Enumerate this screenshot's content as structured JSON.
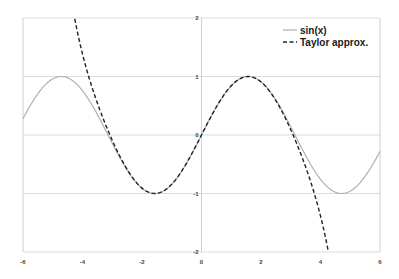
{
  "chart_data": {
    "type": "line",
    "title": "",
    "xlabel": "",
    "ylabel": "",
    "xlim": [
      -6,
      6
    ],
    "ylim": [
      -2,
      2
    ],
    "x_ticks": [
      "-6",
      "-4",
      "-2",
      "0",
      "2",
      "4",
      "6"
    ],
    "y_ticks": [
      "-2",
      "-1",
      "0",
      "1",
      "2"
    ],
    "grid": {
      "horizontal": true,
      "vertical": false
    },
    "legend": {
      "position": "upper-right-inside",
      "entries": [
        "sin(x)",
        "Taylor approx."
      ]
    },
    "series": [
      {
        "name": "sin(x)",
        "style": "solid",
        "color": "#b0b0b0",
        "function": "sin(x)",
        "x": [
          -6,
          -5,
          -4.71,
          -4,
          -3.14,
          -2,
          -1.57,
          -1,
          0,
          1,
          1.57,
          2,
          3.14,
          4,
          4.71,
          5,
          6
        ],
        "values": [
          0.28,
          0.96,
          1.0,
          0.76,
          0.0,
          -0.91,
          -1.0,
          -0.84,
          0.0,
          0.84,
          1.0,
          0.91,
          0.0,
          -0.76,
          -1.0,
          -0.96,
          -0.28
        ]
      },
      {
        "name": "Taylor approx.",
        "style": "dashed",
        "color": "#222222",
        "function": "x - x^3/6 + x^5/120 - x^7/5040",
        "x": [
          -4.25,
          -4,
          -3,
          -2,
          -1.57,
          -1,
          0,
          1,
          1.57,
          2,
          3,
          4,
          4.25
        ],
        "values": [
          2.0,
          1.25,
          -0.02,
          -0.91,
          -1.0,
          -0.84,
          0.0,
          0.84,
          1.0,
          0.91,
          0.02,
          -1.25,
          -2.0
        ]
      }
    ]
  },
  "colors": {
    "sin_line": "#b0b0b0",
    "taylor_line": "#222222",
    "grid": "#dcdcdc",
    "axis": "#cfcfcf",
    "tick_text": "#444444"
  }
}
